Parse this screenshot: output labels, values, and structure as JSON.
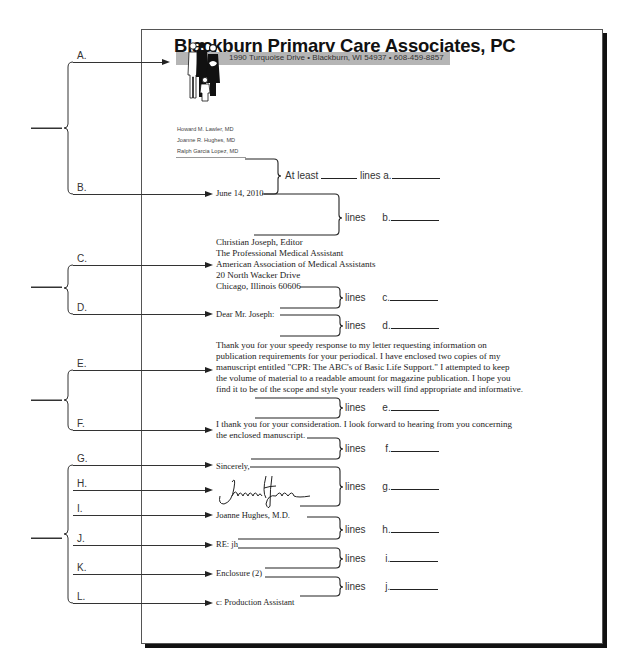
{
  "letterhead": {
    "practice_name": "Blackburn Primary Care Associates, PC",
    "address_line": "1990 Turquoise Drive  •  Blackburn, WI 54937  •  608-459-8857",
    "logo_icon": "family-figures-icon",
    "doctors": [
      "Howard M. Lawler, MD",
      "Joanne R. Hughes, MD",
      "Ralph Garcia Lopez, MD"
    ]
  },
  "letter": {
    "date": "June 14, 2010",
    "inside_address": [
      "Christian Joseph, Editor",
      "The Professional Medical Assistant",
      "American Association of Medical Assistants",
      "20 North Wacker Drive",
      "Chicago, Illinois 60606"
    ],
    "salutation": "Dear Mr. Joseph:",
    "body_paragraph_1": [
      "Thank you for your speedy response to my letter requesting information on",
      "publication requirements for your periodical.  I have enclosed two copies of my",
      "manuscript entitled \"CPR: The ABC's of Basic Life Support.\"  I attempted to keep",
      "the volume of material to a readable amount for magazine publication.  I hope you",
      "find it to be of the scope and style your  readers will find appropriate and informative."
    ],
    "body_paragraph_2": [
      "I thank you for your consideration.  I look forward to hearing from you concerning",
      "the enclosed manuscript."
    ],
    "closing": "Sincerely,",
    "signature": "Joanne Hughes",
    "signer": "Joanne Hughes, M.D.",
    "reference_initials": "RE: jh",
    "enclosure": "Enclosure (2)",
    "copy_notation": "c: Production Assistant"
  },
  "part_labels": [
    "A.",
    "B.",
    "C.",
    "D.",
    "E.",
    "F.",
    "G.",
    "H.",
    "I.",
    "J.",
    "K.",
    "L."
  ],
  "spacing_questions": [
    {
      "prefix": "At least",
      "word": "lines",
      "letter": "a."
    },
    {
      "prefix": "",
      "word": "lines",
      "letter": "b."
    },
    {
      "prefix": "",
      "word": "lines",
      "letter": "c."
    },
    {
      "prefix": "",
      "word": "lines",
      "letter": "d."
    },
    {
      "prefix": "",
      "word": "lines",
      "letter": "e."
    },
    {
      "prefix": "",
      "word": "lines",
      "letter": "f."
    },
    {
      "prefix": "",
      "word": "lines",
      "letter": "g."
    },
    {
      "prefix": "",
      "word": "lines",
      "letter": "h."
    },
    {
      "prefix": "",
      "word": "lines",
      "letter": "i."
    },
    {
      "prefix": "",
      "word": "lines",
      "letter": "j."
    }
  ]
}
